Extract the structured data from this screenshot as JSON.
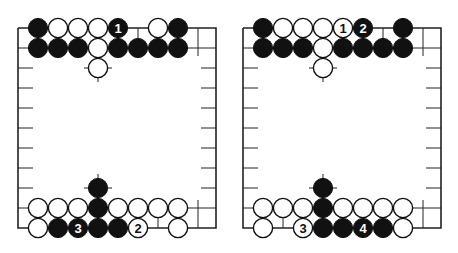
{
  "board": {
    "origin_x": 18,
    "origin_y": 28,
    "spacing": 20,
    "cols": 11,
    "top_rows": 3,
    "bottom_row_y": 228,
    "stone_radius": 9.6,
    "side_tick_rows_y": [
      88,
      108,
      128,
      148,
      168,
      188
    ],
    "colors": {
      "black": "#111111",
      "white": "#ffffff",
      "line": "#222222"
    }
  },
  "diagrams": [
    {
      "name": "diagram-left",
      "top_stones": [
        {
          "col": 1,
          "row": 0,
          "color": "black"
        },
        {
          "col": 2,
          "row": 0,
          "color": "white"
        },
        {
          "col": 3,
          "row": 0,
          "color": "white"
        },
        {
          "col": 4,
          "row": 0,
          "color": "white"
        },
        {
          "col": 5,
          "row": 0,
          "color": "black",
          "label": "1"
        },
        {
          "col": 7,
          "row": 0,
          "color": "white"
        },
        {
          "col": 8,
          "row": 0,
          "color": "black"
        },
        {
          "col": 1,
          "row": 1,
          "color": "black"
        },
        {
          "col": 2,
          "row": 1,
          "color": "black"
        },
        {
          "col": 3,
          "row": 1,
          "color": "black"
        },
        {
          "col": 4,
          "row": 1,
          "color": "white"
        },
        {
          "col": 5,
          "row": 1,
          "color": "black"
        },
        {
          "col": 6,
          "row": 1,
          "color": "black"
        },
        {
          "col": 7,
          "row": 1,
          "color": "black"
        },
        {
          "col": 8,
          "row": 1,
          "color": "black"
        },
        {
          "col": 4,
          "row": 2,
          "color": "white"
        }
      ],
      "bottom_stones": [
        {
          "col": 4,
          "row": 2,
          "color": "black"
        },
        {
          "col": 1,
          "row": 1,
          "color": "white"
        },
        {
          "col": 2,
          "row": 1,
          "color": "white"
        },
        {
          "col": 3,
          "row": 1,
          "color": "white"
        },
        {
          "col": 4,
          "row": 1,
          "color": "black"
        },
        {
          "col": 5,
          "row": 1,
          "color": "white"
        },
        {
          "col": 6,
          "row": 1,
          "color": "white"
        },
        {
          "col": 7,
          "row": 1,
          "color": "white"
        },
        {
          "col": 8,
          "row": 1,
          "color": "white"
        },
        {
          "col": 1,
          "row": 0,
          "color": "white"
        },
        {
          "col": 2,
          "row": 0,
          "color": "black"
        },
        {
          "col": 3,
          "row": 0,
          "color": "black",
          "label": "3"
        },
        {
          "col": 4,
          "row": 0,
          "color": "black"
        },
        {
          "col": 5,
          "row": 0,
          "color": "black"
        },
        {
          "col": 6,
          "row": 0,
          "color": "white",
          "label": "2"
        },
        {
          "col": 8,
          "row": 0,
          "color": "white"
        }
      ]
    },
    {
      "name": "diagram-right",
      "top_stones": [
        {
          "col": 1,
          "row": 0,
          "color": "black"
        },
        {
          "col": 2,
          "row": 0,
          "color": "white"
        },
        {
          "col": 3,
          "row": 0,
          "color": "white"
        },
        {
          "col": 4,
          "row": 0,
          "color": "white"
        },
        {
          "col": 5,
          "row": 0,
          "color": "white",
          "label": "1"
        },
        {
          "col": 6,
          "row": 0,
          "color": "black",
          "label": "2"
        },
        {
          "col": 8,
          "row": 0,
          "color": "black"
        },
        {
          "col": 1,
          "row": 1,
          "color": "black"
        },
        {
          "col": 2,
          "row": 1,
          "color": "black"
        },
        {
          "col": 3,
          "row": 1,
          "color": "black"
        },
        {
          "col": 4,
          "row": 1,
          "color": "white"
        },
        {
          "col": 5,
          "row": 1,
          "color": "black"
        },
        {
          "col": 6,
          "row": 1,
          "color": "black"
        },
        {
          "col": 7,
          "row": 1,
          "color": "black"
        },
        {
          "col": 8,
          "row": 1,
          "color": "black"
        },
        {
          "col": 4,
          "row": 2,
          "color": "white"
        }
      ],
      "bottom_stones": [
        {
          "col": 4,
          "row": 2,
          "color": "black"
        },
        {
          "col": 1,
          "row": 1,
          "color": "white"
        },
        {
          "col": 2,
          "row": 1,
          "color": "white"
        },
        {
          "col": 3,
          "row": 1,
          "color": "white"
        },
        {
          "col": 4,
          "row": 1,
          "color": "black"
        },
        {
          "col": 5,
          "row": 1,
          "color": "white"
        },
        {
          "col": 6,
          "row": 1,
          "color": "white"
        },
        {
          "col": 7,
          "row": 1,
          "color": "white"
        },
        {
          "col": 8,
          "row": 1,
          "color": "white"
        },
        {
          "col": 1,
          "row": 0,
          "color": "white"
        },
        {
          "col": 3,
          "row": 0,
          "color": "white",
          "label": "3"
        },
        {
          "col": 4,
          "row": 0,
          "color": "black"
        },
        {
          "col": 5,
          "row": 0,
          "color": "black"
        },
        {
          "col": 6,
          "row": 0,
          "color": "black",
          "label": "4"
        },
        {
          "col": 7,
          "row": 0,
          "color": "black"
        },
        {
          "col": 8,
          "row": 0,
          "color": "white"
        }
      ]
    }
  ]
}
